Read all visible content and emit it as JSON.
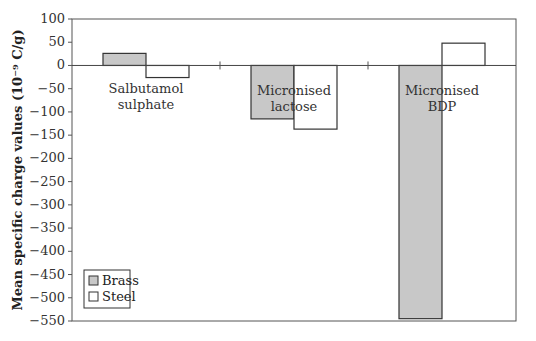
{
  "chart_data": {
    "type": "bar",
    "title": "",
    "xlabel": "",
    "ylabel": "Mean specific charge values (10⁻⁹ C/g)",
    "ylim": [
      -550,
      100
    ],
    "yticks": [
      100,
      50,
      0,
      -50,
      -100,
      -150,
      -200,
      -250,
      -300,
      -350,
      -400,
      -450,
      -500,
      -550
    ],
    "ytick_labels": [
      "100",
      "50",
      "0",
      "−50",
      "−100",
      "−150",
      "−200",
      "−250",
      "−300",
      "−350",
      "−400",
      "−450",
      "−500",
      "−550"
    ],
    "grid": false,
    "legend_position": "lower-left",
    "categories": [
      "Salbutamol sulphate",
      "Micronised lactose",
      "Micronised BDP"
    ],
    "category_label_lines": [
      [
        "Salbutamol",
        "sulphate"
      ],
      [
        "Micronised",
        "lactose"
      ],
      [
        "Micronised",
        "BDP"
      ]
    ],
    "series": [
      {
        "name": "Brass",
        "color": "#c8c8c8",
        "values": [
          26,
          -115,
          -545
        ]
      },
      {
        "name": "Steel",
        "color": "#ffffff",
        "values": [
          -26,
          -137,
          48
        ]
      }
    ]
  },
  "legend": {
    "items": [
      {
        "label": "Brass",
        "color": "#c8c8c8"
      },
      {
        "label": "Steel",
        "color": "#ffffff"
      }
    ]
  }
}
